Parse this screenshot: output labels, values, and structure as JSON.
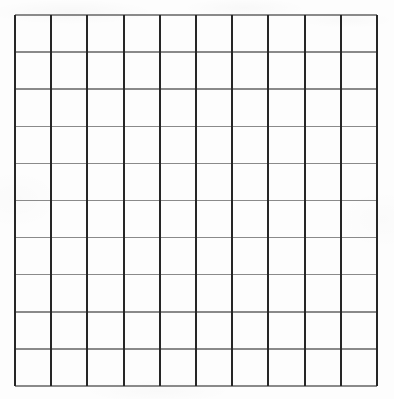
{
  "image": {
    "title": "Blank 10 by 10 grid",
    "width": 394,
    "height": 399,
    "background_color": "#fdfdfd"
  },
  "grid": {
    "name": "blank-grid",
    "columns": 10,
    "rows": 10,
    "cell_count": 100,
    "filled_cells": 0,
    "cell_labels": [],
    "origin_x": 15,
    "origin_y": 15,
    "width": 362,
    "height": 371,
    "cell_width": 36.2,
    "cell_height": 37.1,
    "vertical_line_color": "#262626",
    "vertical_line_width": 2,
    "horizontal_line_color": "#8a8a8a",
    "horizontal_line_width": 1.5,
    "vertical_line_positions": [
      15,
      51.2,
      87.4,
      123.6,
      159.8,
      196,
      232.2,
      268.4,
      304.6,
      340.8,
      377
    ],
    "horizontal_line_positions": [
      15,
      52.1,
      89.2,
      126.3,
      163.4,
      200.5,
      237.6,
      274.7,
      311.8,
      348.9,
      386
    ]
  }
}
